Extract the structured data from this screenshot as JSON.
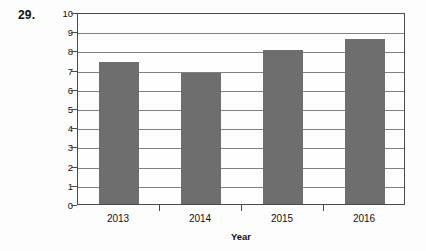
{
  "problem": {
    "number": "29."
  },
  "chart_data": {
    "type": "bar",
    "title": "",
    "categories": [
      "2013",
      "2014",
      "2015",
      "2016"
    ],
    "values": [
      7.4,
      6.8,
      8.0,
      8.6
    ],
    "series": [
      {
        "name": "Sales",
        "values": [
          7.4,
          6.8,
          8.0,
          8.6
        ]
      }
    ],
    "xlabel": "Year",
    "ylabel": "Sales in millions of dollars",
    "ylim": [
      0,
      10
    ],
    "ytick_labels": [
      "0",
      "1",
      "2",
      "3",
      "4",
      "5",
      "6",
      "7",
      "8",
      "9",
      "10"
    ],
    "ytick_values": [
      0,
      1,
      2,
      3,
      4,
      5,
      6,
      7,
      8,
      9,
      10
    ],
    "grid": true,
    "legend": "none",
    "bar_color": "#6e6e6e",
    "axis_color": "#4a4a4a",
    "grid_color": "#808080",
    "background": "#fdfdfd"
  }
}
